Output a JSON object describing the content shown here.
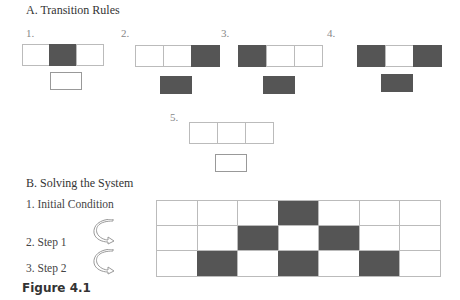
{
  "section_a": {
    "title": "A. Transition Rules",
    "rules": [
      {
        "label": "1.",
        "pattern": [
          0,
          1,
          0
        ],
        "output": 0
      },
      {
        "label": "2.",
        "pattern": [
          0,
          0,
          1
        ],
        "output": 1
      },
      {
        "label": "3.",
        "pattern": [
          1,
          0,
          0
        ],
        "output": 1
      },
      {
        "label": "4.",
        "pattern": [
          1,
          0,
          1
        ],
        "output": 1
      },
      {
        "label": "5.",
        "pattern": [
          0,
          0,
          0
        ],
        "output": 0
      }
    ]
  },
  "section_b": {
    "title": "B. Solving the System",
    "steps": [
      {
        "label": "1. Initial Condition"
      },
      {
        "label": "2. Step 1"
      },
      {
        "label": "3. Step 2"
      }
    ],
    "grid": [
      [
        0,
        0,
        0,
        1,
        0,
        0,
        0
      ],
      [
        0,
        0,
        1,
        0,
        1,
        0,
        0
      ],
      [
        0,
        1,
        0,
        1,
        0,
        1,
        0
      ]
    ]
  },
  "caption": "Figure 4.1",
  "colors": {
    "filled": "#555555",
    "empty": "#ffffff",
    "border": "#bbbbbb"
  }
}
